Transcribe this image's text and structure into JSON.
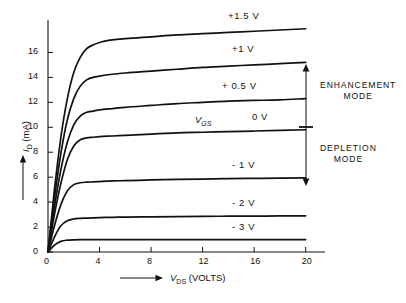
{
  "chart_data": {
    "type": "line",
    "title": "",
    "xlabel": "V_DS (VOLTS)",
    "ylabel": "I_D (mA)",
    "xlabel_symbol": "V",
    "xlabel_sub": "DS",
    "xlabel_unit": "(VOLTS)",
    "ylabel_symbol": "I",
    "ylabel_sub": "D",
    "ylabel_unit": "(mA)",
    "xlim": [
      0,
      21.5
    ],
    "ylim": [
      0,
      18.6
    ],
    "xticks": [
      0,
      4,
      8,
      12,
      16,
      20
    ],
    "xtick_labels": [
      "0",
      "4",
      "8",
      "12",
      "16",
      "20"
    ],
    "yticks": [
      0,
      2,
      4,
      6,
      8,
      10,
      12,
      14,
      16
    ],
    "ytick_labels": [
      "0",
      "2",
      "4",
      "6",
      "8",
      "10",
      "12",
      "14",
      "16"
    ],
    "grid": false,
    "legend_position": "inline-right",
    "series_param_symbol": "V",
    "series_param_sub": "GS",
    "series_param_label": "V_GS",
    "series": [
      {
        "name": "+1.5 V",
        "vgs": 1.5,
        "i_sat_at_20V": 17.9,
        "knee_v": 4.6,
        "x": [
          0,
          0.5,
          1,
          1.5,
          2,
          2.5,
          3,
          3.5,
          4,
          5,
          6,
          8,
          10,
          12,
          14,
          16,
          18,
          20
        ],
        "values": [
          0,
          5.0,
          9.2,
          12.3,
          14.4,
          15.6,
          16.3,
          16.6,
          16.8,
          17.0,
          17.1,
          17.25,
          17.4,
          17.5,
          17.6,
          17.7,
          17.8,
          17.9
        ]
      },
      {
        "name": "+1 V",
        "vgs": 1.0,
        "i_sat_at_20V": 15.2,
        "knee_v": 3.8,
        "x": [
          0,
          0.5,
          1,
          1.5,
          2,
          2.5,
          3,
          3.5,
          4,
          5,
          6,
          8,
          10,
          12,
          14,
          16,
          18,
          20
        ],
        "values": [
          0,
          4.3,
          7.9,
          10.6,
          12.3,
          13.3,
          13.8,
          14.0,
          14.1,
          14.25,
          14.35,
          14.5,
          14.65,
          14.8,
          14.9,
          15.0,
          15.1,
          15.2
        ]
      },
      {
        "name": "+ 0.5 V",
        "vgs": 0.5,
        "i_sat_at_20V": 12.3,
        "knee_v": 3.2,
        "x": [
          0,
          0.5,
          1,
          1.5,
          2,
          2.5,
          3,
          3.5,
          4,
          5,
          6,
          8,
          10,
          12,
          14,
          16,
          18,
          20
        ],
        "values": [
          0,
          3.6,
          6.6,
          8.8,
          10.2,
          10.9,
          11.2,
          11.3,
          11.4,
          11.5,
          11.6,
          11.75,
          11.9,
          12.0,
          12.1,
          12.15,
          12.2,
          12.3
        ]
      },
      {
        "name": "0 V",
        "vgs": 0.0,
        "i_sat_at_20V": 9.8,
        "knee_v": 2.8,
        "x": [
          0,
          0.5,
          1,
          1.5,
          2,
          2.5,
          3,
          3.5,
          4,
          5,
          6,
          8,
          10,
          12,
          14,
          16,
          18,
          20
        ],
        "values": [
          0,
          3.0,
          5.5,
          7.4,
          8.5,
          9.0,
          9.15,
          9.2,
          9.25,
          9.3,
          9.35,
          9.45,
          9.55,
          9.6,
          9.65,
          9.7,
          9.75,
          9.8
        ]
      },
      {
        "name": "- 1 V",
        "vgs": -1.0,
        "i_sat_at_20V": 5.95,
        "knee_v": 2.2,
        "x": [
          0,
          0.5,
          1,
          1.5,
          2,
          2.5,
          3,
          3.5,
          4,
          5,
          6,
          8,
          10,
          12,
          14,
          16,
          18,
          20
        ],
        "values": [
          0,
          2.1,
          3.8,
          4.9,
          5.4,
          5.55,
          5.6,
          5.62,
          5.65,
          5.7,
          5.72,
          5.78,
          5.82,
          5.85,
          5.88,
          5.9,
          5.92,
          5.95
        ]
      },
      {
        "name": "- 2 V",
        "vgs": -2.0,
        "i_sat_at_20V": 2.9,
        "knee_v": 1.6,
        "x": [
          0,
          0.5,
          1,
          1.5,
          2,
          2.5,
          3,
          3.5,
          4,
          5,
          6,
          8,
          10,
          12,
          14,
          16,
          18,
          20
        ],
        "values": [
          0,
          1.2,
          2.1,
          2.5,
          2.65,
          2.7,
          2.72,
          2.74,
          2.76,
          2.78,
          2.8,
          2.82,
          2.84,
          2.86,
          2.87,
          2.88,
          2.89,
          2.9
        ]
      },
      {
        "name": "- 3 V",
        "vgs": -3.0,
        "i_sat_at_20V": 1.0,
        "knee_v": 1.1,
        "x": [
          0,
          0.5,
          1,
          1.5,
          2,
          2.5,
          3,
          3.5,
          4,
          5,
          6,
          8,
          10,
          12,
          14,
          16,
          18,
          20
        ],
        "values": [
          0,
          0.55,
          0.85,
          0.95,
          0.98,
          0.99,
          0.99,
          1.0,
          1.0,
          1.0,
          1.0,
          1.0,
          1.0,
          1.0,
          1.0,
          1.0,
          1.0,
          1.0
        ]
      }
    ],
    "annotations": [
      {
        "text": "ENHANCEMENT MODE",
        "line1": "ENHANCEMENT",
        "line2": "MODE",
        "range_vgs": [
          0,
          1.5
        ]
      },
      {
        "text": "DEPLETION MODE",
        "line1": "DEPLETION",
        "line2": "MODE",
        "range_vgs": [
          -1.0,
          0
        ]
      }
    ]
  },
  "axes": {
    "x_axis_name": "drain-source-voltage-axis",
    "y_axis_name": "drain-current-axis"
  }
}
